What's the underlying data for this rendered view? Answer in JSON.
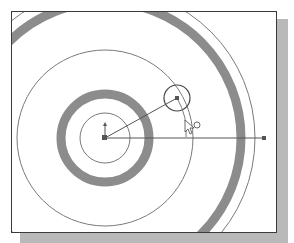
{
  "diagram": {
    "type": "cad-sketch-concentric-circles",
    "center": {
      "x": 93,
      "y": 126
    },
    "colors": {
      "frame_border": "#3a3a3a",
      "thick_ring": "#8c8c8c",
      "thin_line": "#7a7a7a",
      "shadow": "#b9b9b9",
      "point": "#555555"
    },
    "circles": [
      {
        "name": "inner-thin-circle",
        "r": 25,
        "style": "thin"
      },
      {
        "name": "inner-thick-ring",
        "r": 45,
        "style": "thick"
      },
      {
        "name": "middle-thin-circle",
        "r": 88,
        "style": "thin"
      },
      {
        "name": "outer-thick-ring",
        "r": 137,
        "style": "thick"
      },
      {
        "name": "outer-thin-circle",
        "r": 150,
        "style": "thin"
      }
    ],
    "small_circle": {
      "cx": 165,
      "cy": 86,
      "r": 13
    },
    "horizontal_line_end": {
      "x": 252,
      "y": 126
    },
    "cursor_icon": "pointer-with-circle-icon"
  }
}
